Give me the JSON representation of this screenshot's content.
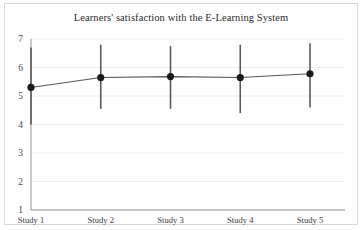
{
  "chart_data": {
    "type": "line",
    "title": "Learners' satisfaction with the E-Learning System",
    "xlabel": "",
    "ylabel": "",
    "categories": [
      "Study 1",
      "Study 2",
      "Study 3",
      "Study 4",
      "Study 5"
    ],
    "values": [
      5.3,
      5.65,
      5.68,
      5.65,
      5.78
    ],
    "error_low": [
      4.0,
      4.55,
      4.55,
      4.4,
      4.6
    ],
    "error_high": [
      6.7,
      6.8,
      6.75,
      6.8,
      6.85
    ],
    "series": [
      {
        "name": "Learners' satisfaction",
        "values": [
          5.3,
          5.65,
          5.68,
          5.65,
          5.78
        ]
      }
    ],
    "ylim": [
      1,
      7
    ],
    "yticks": [
      1,
      2,
      3,
      4,
      5,
      6,
      7
    ],
    "ytick_labels": [
      "1",
      "2",
      "3",
      "4",
      "5",
      "6",
      "7"
    ],
    "grid": true,
    "legend": false,
    "marker": "circle",
    "error_bars": true,
    "colors": {
      "marker": "#1b1b1b",
      "line": "#585858",
      "errorbar": "#5a5a5a",
      "grid": "#e9e9e9",
      "axis": "#8a8a8a",
      "text": "#2b2b2b",
      "background": "#ffffff",
      "border": "#d8d8d8"
    }
  }
}
